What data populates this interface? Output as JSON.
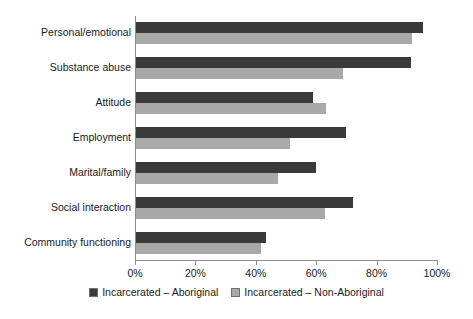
{
  "chart_data": {
    "type": "bar",
    "orientation": "horizontal",
    "title": "",
    "xlabel": "",
    "ylabel": "",
    "xlim": [
      0,
      100
    ],
    "grid": false,
    "legend_position": "bottom",
    "xticks": [
      {
        "value": 0,
        "label": "0%"
      },
      {
        "value": 20,
        "label": "20%"
      },
      {
        "value": 40,
        "label": "40%"
      },
      {
        "value": 60,
        "label": "60%"
      },
      {
        "value": 80,
        "label": "80%"
      },
      {
        "value": 100,
        "label": "100%"
      }
    ],
    "categories": [
      "Personal/emotional",
      "Substance abuse",
      "Attitude",
      "Employment",
      "Marital/family",
      "Social interaction",
      "Community functioning"
    ],
    "series": [
      {
        "name": "Incarcerated – Aboriginal",
        "color": "#3a3a3a",
        "values": [
          95,
          91,
          58.5,
          69.5,
          59.5,
          72,
          43
        ]
      },
      {
        "name": "Incarcerated – Non-Aboriginal",
        "color": "#a9a9a9",
        "values": [
          91.5,
          68.5,
          63,
          51,
          47,
          62.5,
          41.5
        ]
      }
    ]
  },
  "legend": {
    "items": [
      {
        "label": "Incarcerated – Aboriginal",
        "color": "#3a3a3a"
      },
      {
        "label": "Incarcerated – Non-Aboriginal",
        "color": "#a9a9a9"
      }
    ]
  }
}
